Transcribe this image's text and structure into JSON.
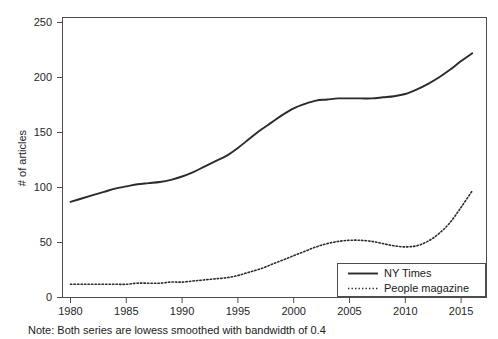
{
  "chart_data": {
    "type": "line",
    "title": "",
    "xlabel": "",
    "ylabel": "# of articles",
    "xlim": [
      1979,
      1917
    ],
    "x_axis_range": [
      1979,
      1917
    ],
    "xlim_actual": [
      1979,
      2017
    ],
    "ylim": [
      0,
      260
    ],
    "grid": false,
    "legend_position": "bottom-right-inside",
    "x_ticks": [
      1980,
      1985,
      1990,
      1995,
      2000,
      2005,
      2010,
      2015
    ],
    "x_tick_labels": [
      "1980",
      "1985",
      "1990",
      "1995",
      "2000",
      "2005",
      "2010",
      "2015"
    ],
    "y_ticks": [
      0,
      50,
      100,
      150,
      200,
      250
    ],
    "y_tick_labels": [
      "0",
      "50",
      "100",
      "150",
      "200",
      "250"
    ],
    "x": [
      1980,
      1981,
      1982,
      1983,
      1984,
      1985,
      1986,
      1987,
      1988,
      1989,
      1990,
      1991,
      1992,
      1993,
      1994,
      1995,
      1996,
      1997,
      1998,
      1999,
      2000,
      2001,
      2002,
      2003,
      2004,
      2005,
      2006,
      2007,
      2008,
      2009,
      2010,
      2011,
      2012,
      2013,
      2014,
      2015,
      2016
    ],
    "series": [
      {
        "name": "NY Times",
        "style": "solid",
        "color": "#2b2b2b",
        "values": [
          87,
          90,
          93,
          96,
          99,
          101,
          103,
          104,
          105,
          107,
          110,
          114,
          119,
          124,
          129,
          136,
          144,
          152,
          159,
          166,
          172,
          176,
          179,
          180,
          181,
          181,
          181,
          181,
          182,
          183,
          185,
          189,
          194,
          200,
          207,
          215,
          222
        ]
      },
      {
        "name": "People magazine",
        "style": "dotted",
        "color": "#2b2b2b",
        "values": [
          12,
          12,
          12,
          12,
          12,
          12,
          13,
          13,
          13,
          14,
          14,
          15,
          16,
          17,
          18,
          20,
          23,
          26,
          30,
          34,
          38,
          42,
          46,
          49,
          51,
          52,
          52,
          51,
          49,
          47,
          46,
          47,
          51,
          58,
          68,
          82,
          97
        ]
      }
    ],
    "note": "Note: Both series are lowess smoothed with bandwidth of 0.4"
  },
  "legend": {
    "entries": [
      {
        "label": "NY Times",
        "style": "solid"
      },
      {
        "label": "People magazine",
        "style": "dotted"
      }
    ]
  },
  "axes": {
    "y_title": "# of articles"
  },
  "footer": {
    "note": "Note: Both series are lowess smoothed with bandwidth of 0.4"
  }
}
